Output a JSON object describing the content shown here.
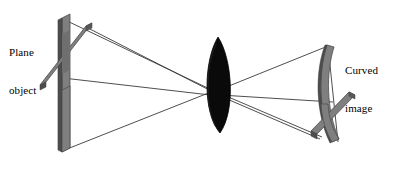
{
  "figure": {
    "width": 394,
    "height": 172,
    "background_color": "#ffffff"
  },
  "labels": {
    "plane_object": {
      "line1": "Plane",
      "line2": "object"
    },
    "curved_image": {
      "line1": "Curved",
      "line2": "image"
    }
  },
  "colors": {
    "lens_fill": "#0a0a0a",
    "bar_face": "#7f7f7f",
    "bar_edge": "#4d4d4d",
    "bar_shadow": "#606060",
    "ray_line": "#3a3a3a",
    "text": "#000000"
  },
  "elements": {
    "plane_object": {
      "name": "plane-object",
      "description": "vertical planar slab with a diagonal cross bar",
      "slab_top": [
        62,
        18
      ],
      "slab_bottom": [
        62,
        152
      ],
      "cross_bar": "diagonal"
    },
    "lens": {
      "name": "convex-lens",
      "description": "biconvex lens drawn as a filled black lens shape",
      "center": [
        218,
        85
      ],
      "half_height": 48,
      "half_width": 17
    },
    "curved_image": {
      "name": "curved-image",
      "description": "curved inverted image of the plane object",
      "top": [
        327,
        45
      ],
      "bottom": [
        330,
        140
      ]
    },
    "rays": {
      "name": "ray-bundle",
      "count": 6,
      "description": "straight ray lines from object extremes through the lens to the image extremes"
    }
  }
}
